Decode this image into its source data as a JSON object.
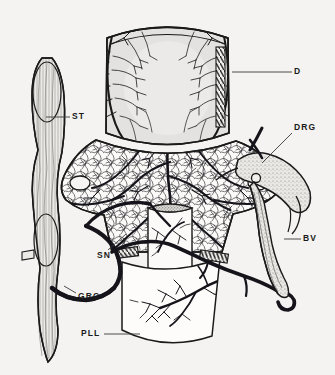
{
  "figure": {
    "title_strip": "INNERVATION OF THE DISC",
    "background_color": "#f4f3f1",
    "ink_color": "#1a1a1a",
    "disc_fill": "#e3e2e0",
    "stipple_fill": "#d8d7d4"
  },
  "labels": [
    {
      "id": "D",
      "text": "D",
      "x": 298,
      "y": 72,
      "leader": "horizontal-left"
    },
    {
      "id": "DRG",
      "text": "DRG",
      "x": 297,
      "y": 128,
      "leader": "diagonal-down-left"
    },
    {
      "id": "BV",
      "text": "BV",
      "x": 305,
      "y": 239,
      "leader": "horizontal-left"
    },
    {
      "id": "ST",
      "text": "ST",
      "x": 75,
      "y": 117,
      "leader": "horizontal-left"
    },
    {
      "id": "SN",
      "text": "SN",
      "x": 100,
      "y": 256,
      "leader": "diagonal-up-right"
    },
    {
      "id": "GRC",
      "text": "GRC",
      "x": 80,
      "y": 297,
      "leader": "diagonal-up-left"
    },
    {
      "id": "PLL",
      "text": "PLL",
      "x": 84,
      "y": 334,
      "leader": "horizontal-right"
    }
  ],
  "legend_meaning": {
    "D": "Intervertebral disc",
    "DRG": "Dorsal root ganglion",
    "BV": "Blood vessel",
    "ST": "Sympathetic trunk",
    "SN": "Sinuvertebral nerve",
    "GRC": "Gray ramus communicans",
    "PLL": "Posterior longitudinal ligament"
  },
  "structures": [
    {
      "name": "intervertebral-disc",
      "label_ref": "D"
    },
    {
      "name": "vertebral-body-vascular-plexus",
      "label_ref": null
    },
    {
      "name": "sympathetic-trunk",
      "label_ref": "ST"
    },
    {
      "name": "dorsal-root-ganglion",
      "label_ref": "DRG"
    },
    {
      "name": "blood-vessel",
      "label_ref": "BV"
    },
    {
      "name": "sinuvertebral-nerve",
      "label_ref": "SN"
    },
    {
      "name": "gray-ramus-communicans",
      "label_ref": "GRC"
    },
    {
      "name": "posterior-longitudinal-ligament",
      "label_ref": "PLL"
    },
    {
      "name": "inset-cutaway-cylinder",
      "label_ref": null
    }
  ]
}
